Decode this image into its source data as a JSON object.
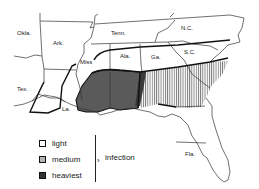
{
  "map": {
    "states": [
      {
        "id": "okla",
        "label": "Okla.",
        "x": 17,
        "y": 35
      },
      {
        "id": "ark",
        "label": "Ark.",
        "x": 53,
        "y": 45
      },
      {
        "id": "tenn",
        "label": "Tenn.",
        "x": 111,
        "y": 35
      },
      {
        "id": "nc",
        "label": "N.C.",
        "x": 181,
        "y": 30
      },
      {
        "id": "miss",
        "label": "Miss",
        "x": 80,
        "y": 64
      },
      {
        "id": "ala",
        "label": "Ala.",
        "x": 120,
        "y": 58
      },
      {
        "id": "ga",
        "label": "Ga.",
        "x": 151,
        "y": 59
      },
      {
        "id": "sc",
        "label": "S.C.",
        "x": 184,
        "y": 54
      },
      {
        "id": "tex",
        "label": "Tex.",
        "x": 17,
        "y": 91
      },
      {
        "id": "la",
        "label": "La.",
        "x": 62,
        "y": 111
      },
      {
        "id": "fla",
        "label": "Fla.",
        "x": 185,
        "y": 156
      }
    ],
    "zones": {
      "light_color": "#ffffff",
      "medium_color": "#b8b8b8",
      "heaviest_color": "#555555"
    }
  },
  "legend": {
    "items": [
      {
        "label": "light",
        "color": "#ffffff"
      },
      {
        "label": "medium",
        "color": "#b5b5b5"
      },
      {
        "label": "heaviest",
        "color": "#333333"
      }
    ],
    "group_label": "infection"
  }
}
